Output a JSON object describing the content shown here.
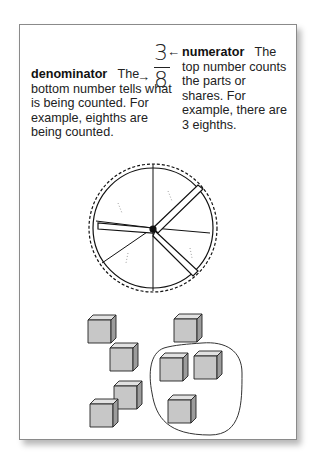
{
  "fraction": {
    "numerator": "3",
    "denominator": "8",
    "arrow_numerator": "←",
    "arrow_denominator": "→"
  },
  "numerator_note": {
    "term": "numerator",
    "text": "The top number counts the parts or shares. For example, there are 3 eighths."
  },
  "denominator_note": {
    "term": "denominator",
    "text": "The bottom number tells what is being counted. For example, eighths are being counted."
  },
  "illustrations": {
    "pie": {
      "slices": 8,
      "pulled_out_slices": 3,
      "label": "pie-cut-in-eighths"
    },
    "cubes": {
      "total": 8,
      "circled": 3,
      "label": "cubes-with-3-circled"
    }
  }
}
